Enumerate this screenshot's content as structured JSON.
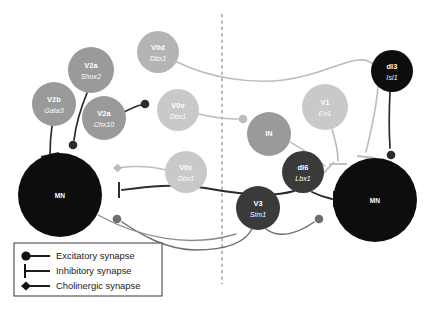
{
  "figure": {
    "midline": {
      "name": "midline",
      "style": "dashed",
      "color": "#8a8a8a"
    }
  },
  "colors": {
    "background": "#ffffff",
    "node_light": "#c9c9c9",
    "node_midlight": "#b4b4b4",
    "node_mid": "#9a9a9a",
    "node_dark": "#3a3a3a",
    "node_black": "#0d0d0d",
    "edge_dark": "#2b2b2b",
    "edge_light": "#b9b9b9",
    "edge_mid": "#8c8c8c",
    "legend_border": "#4a4a4a",
    "text_white": "#ffffff",
    "text_black": "#1b1b1b",
    "caption": "#8e8e8e"
  },
  "nodes": [
    {
      "id": "v2b",
      "name": "V2b",
      "gene": "Gata3",
      "cx": 54,
      "cy": 104,
      "r": 22,
      "shade": "node_mid",
      "side": "left"
    },
    {
      "id": "v2a_shox2",
      "name": "V2a",
      "gene": "Shox2",
      "cx": 91,
      "cy": 70,
      "r": 23,
      "shade": "node_mid",
      "side": "left"
    },
    {
      "id": "v2a_chx10",
      "name": "V2a",
      "gene": "Chx10",
      "cx": 104,
      "cy": 118,
      "r": 22,
      "shade": "node_mid",
      "side": "left"
    },
    {
      "id": "v0d",
      "name": "V0d",
      "gene": "Dbx1",
      "cx": 158,
      "cy": 52,
      "r": 21,
      "shade": "node_midlight",
      "side": "left"
    },
    {
      "id": "v0v",
      "name": "V0v",
      "gene": "Dbx1",
      "cx": 178,
      "cy": 110,
      "r": 21,
      "shade": "node_light",
      "side": "left"
    },
    {
      "id": "v0c",
      "name": "V0c",
      "gene": "Dbx1",
      "cx": 186,
      "cy": 172,
      "r": 21,
      "shade": "node_light",
      "side": "left"
    },
    {
      "id": "in",
      "name": "IN",
      "gene": "",
      "cx": 269,
      "cy": 134,
      "r": 22,
      "shade": "node_mid",
      "side": "right"
    },
    {
      "id": "v1",
      "name": "V1",
      "gene": "En1",
      "cx": 325,
      "cy": 107,
      "r": 23,
      "shade": "node_light",
      "side": "right"
    },
    {
      "id": "di6",
      "name": "dI6",
      "gene": "Lbx1",
      "cx": 303,
      "cy": 172,
      "r": 21,
      "shade": "node_dark",
      "side": "right"
    },
    {
      "id": "di3",
      "name": "dI3",
      "gene": "Isl1",
      "cx": 392,
      "cy": 71,
      "r": 21,
      "shade": "node_black",
      "side": "right"
    },
    {
      "id": "v3",
      "name": "V3",
      "gene": "Sim1",
      "cx": 258,
      "cy": 208,
      "r": 22,
      "shade": "node_dark",
      "side": "right"
    },
    {
      "id": "mn_left",
      "name": "MN",
      "gene": "",
      "cx": 60,
      "cy": 195,
      "r": 42,
      "shade": "node_black",
      "side": "left"
    },
    {
      "id": "mn_right",
      "name": "MN",
      "gene": "",
      "cx": 375,
      "cy": 200,
      "r": 42,
      "shade": "node_black",
      "side": "right"
    }
  ],
  "legend": {
    "items": [
      {
        "id": "excitatory",
        "label": "Excitatory synapse",
        "terminal": "ball"
      },
      {
        "id": "inhibitory",
        "label": "Inhibitory synapse",
        "terminal": "bar"
      },
      {
        "id": "cholinergic",
        "label": "Cholinergic synapse",
        "terminal": "diamond"
      }
    ]
  },
  "caption": {
    "text": ""
  }
}
